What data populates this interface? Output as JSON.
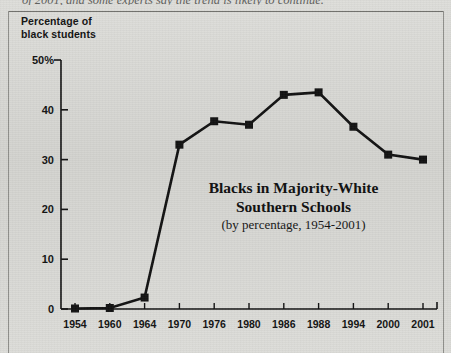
{
  "page": {
    "cutoff_body_text": "of 2001, and some experts say the trend is likely to continue.",
    "axis_caption_line1": "Percentage of",
    "axis_caption_line2": "black students"
  },
  "chart_data": {
    "type": "line",
    "title": "Blacks in Majority-White Southern Schools",
    "title_line1": "Blacks in Majority-White",
    "title_line2": "Southern Schools",
    "subtitle": "(by percentage, 1954-2001)",
    "xlabel": "",
    "ylabel": "Percentage of black students",
    "categories": [
      "1954",
      "1960",
      "1964",
      "1970",
      "1976",
      "1980",
      "1986",
      "1988",
      "1994",
      "2000",
      "2001"
    ],
    "values": [
      0.1,
      0.2,
      2.3,
      33.0,
      37.7,
      37.0,
      43.0,
      43.5,
      36.6,
      31.0,
      30.0
    ],
    "ytick_labels": [
      "50%",
      "40",
      "30",
      "20",
      "10",
      "0"
    ],
    "ytick_values": [
      50,
      40,
      30,
      20,
      10,
      0
    ],
    "ylim": [
      0,
      50
    ],
    "grid": false,
    "legend": "none",
    "marker": "square",
    "line_color": "#111111",
    "marker_color": "#111111",
    "axis_color": "#111111",
    "background_color": "#d9d9d5"
  }
}
